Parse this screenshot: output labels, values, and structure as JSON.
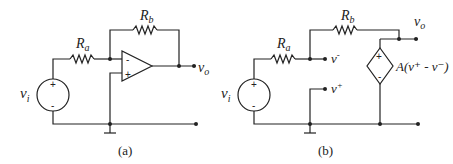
{
  "figure_a": {
    "caption": "(a)",
    "labels": {
      "source": "v",
      "source_sub": "i",
      "ra": "R",
      "ra_sub": "a",
      "rb": "R",
      "rb_sub": "b",
      "output": "v",
      "output_sub": "o"
    },
    "opamp": {
      "inverting": "-",
      "noninverting": "+"
    },
    "source_signs": {
      "plus": "+",
      "minus": "-"
    }
  },
  "figure_b": {
    "caption": "(b)",
    "labels": {
      "source": "v",
      "source_sub": "i",
      "ra": "R",
      "ra_sub": "a",
      "rb": "R",
      "rb_sub": "b",
      "output": "v",
      "output_sub": "o",
      "vminus": "v",
      "vminus_sup": "-",
      "vplus": "v",
      "vplus_sup": "+",
      "dependent_source": "A(v⁺ - v⁻)"
    },
    "source_signs": {
      "plus": "+",
      "minus": "-"
    },
    "dependent_signs": {
      "plus": "+",
      "minus": "-"
    }
  }
}
